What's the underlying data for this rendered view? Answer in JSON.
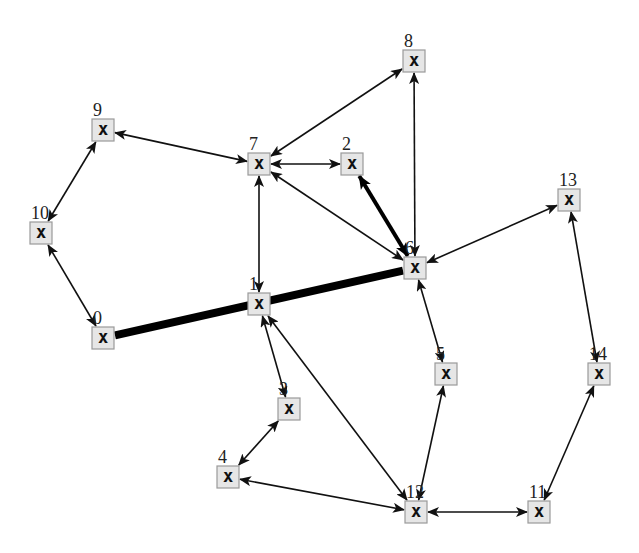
{
  "diagram": {
    "type": "directed-graph",
    "node_glyph": "x",
    "colors": {
      "node_fill": "#e6e6e6",
      "node_border": "#9a9a9a",
      "edge": "#111111",
      "background": "#ffffff"
    },
    "nodes": [
      {
        "id": "0",
        "x": 103,
        "y": 338
      },
      {
        "id": "1",
        "x": 259,
        "y": 304
      },
      {
        "id": "2",
        "x": 352,
        "y": 164
      },
      {
        "id": "3",
        "x": 289,
        "y": 409
      },
      {
        "id": "4",
        "x": 228,
        "y": 477
      },
      {
        "id": "5",
        "x": 446,
        "y": 374
      },
      {
        "id": "6",
        "x": 415,
        "y": 268
      },
      {
        "id": "7",
        "x": 259,
        "y": 164
      },
      {
        "id": "8",
        "x": 414,
        "y": 61
      },
      {
        "id": "9",
        "x": 103,
        "y": 130
      },
      {
        "id": "10",
        "x": 41,
        "y": 233
      },
      {
        "id": "11",
        "x": 539,
        "y": 512
      },
      {
        "id": "12",
        "x": 416,
        "y": 512
      },
      {
        "id": "13",
        "x": 569,
        "y": 200
      },
      {
        "id": "14",
        "x": 599,
        "y": 374
      }
    ],
    "edges": [
      {
        "from": "0",
        "to": "6",
        "style": "thick",
        "arrows": "none"
      },
      {
        "from": "0",
        "to": "10",
        "style": "normal",
        "arrows": "both"
      },
      {
        "from": "10",
        "to": "9",
        "style": "normal",
        "arrows": "both"
      },
      {
        "from": "9",
        "to": "7",
        "style": "normal",
        "arrows": "both"
      },
      {
        "from": "7",
        "to": "2",
        "style": "normal",
        "arrows": "both"
      },
      {
        "from": "7",
        "to": "8",
        "style": "normal",
        "arrows": "both"
      },
      {
        "from": "7",
        "to": "1",
        "style": "normal",
        "arrows": "both"
      },
      {
        "from": "7",
        "to": "6",
        "style": "normal",
        "arrows": "both"
      },
      {
        "from": "2",
        "to": "6",
        "style": "medium",
        "arrows": "both"
      },
      {
        "from": "8",
        "to": "6",
        "style": "normal",
        "arrows": "both"
      },
      {
        "from": "6",
        "to": "13",
        "style": "normal",
        "arrows": "both"
      },
      {
        "from": "6",
        "to": "5",
        "style": "normal",
        "arrows": "both"
      },
      {
        "from": "1",
        "to": "3",
        "style": "normal",
        "arrows": "both"
      },
      {
        "from": "1",
        "to": "12",
        "style": "normal",
        "arrows": "both"
      },
      {
        "from": "3",
        "to": "4",
        "style": "normal",
        "arrows": "both"
      },
      {
        "from": "4",
        "to": "12",
        "style": "normal",
        "arrows": "both"
      },
      {
        "from": "5",
        "to": "12",
        "style": "normal",
        "arrows": "both"
      },
      {
        "from": "12",
        "to": "11",
        "style": "normal",
        "arrows": "both"
      },
      {
        "from": "11",
        "to": "14",
        "style": "normal",
        "arrows": "both"
      },
      {
        "from": "14",
        "to": "13",
        "style": "normal",
        "arrows": "both"
      }
    ]
  }
}
